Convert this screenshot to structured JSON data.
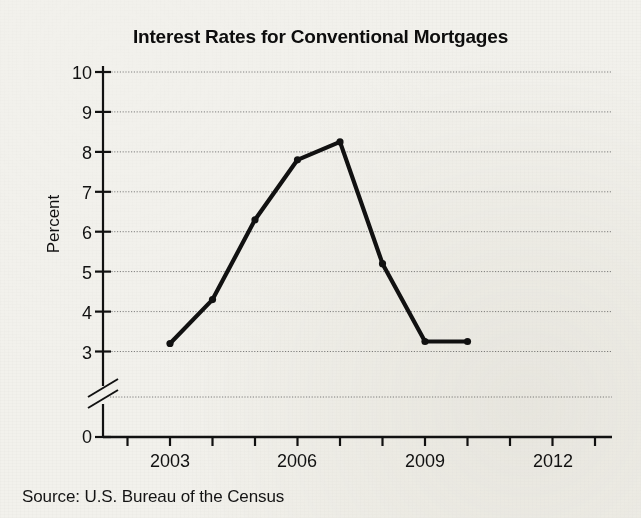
{
  "chart_data": {
    "type": "line",
    "title": "Interest Rates for Conventional Mortgages",
    "xlabel": "",
    "ylabel": "Percent",
    "source": "Source: U.S. Bureau of the Census",
    "x": [
      2003,
      2004,
      2005,
      2006,
      2007,
      2008,
      2009,
      2010
    ],
    "values": [
      3.2,
      4.3,
      6.3,
      7.8,
      8.25,
      5.2,
      3.25,
      3.25
    ],
    "series": [
      {
        "name": "Interest rate",
        "values": [
          3.2,
          4.3,
          6.3,
          7.8,
          8.25,
          5.2,
          3.25,
          3.25
        ]
      }
    ],
    "xlim": [
      2002,
      2013
    ],
    "ylim": [
      3,
      10
    ],
    "y_axis_break": true,
    "y_axis_break_note": "axis broken between 0 and 3",
    "ytick_labels": [
      "10",
      "9",
      "8",
      "7",
      "6",
      "5",
      "4",
      "3",
      "0"
    ],
    "ytick_values": [
      10,
      9,
      8,
      7,
      6,
      5,
      4,
      3,
      0
    ],
    "xtick_values": [
      2002,
      2003,
      2004,
      2005,
      2006,
      2007,
      2008,
      2009,
      2010,
      2011,
      2012,
      2013
    ],
    "xtick_labels_shown": [
      "2003",
      "2006",
      "2009",
      "2012"
    ],
    "xtick_labels_shown_values": [
      2003,
      2006,
      2009,
      2012
    ],
    "grid": "horizontal-dotted",
    "legend": "none",
    "line_color": "#111111",
    "marker": "round-dot",
    "background_color": "#f2f1ec"
  }
}
